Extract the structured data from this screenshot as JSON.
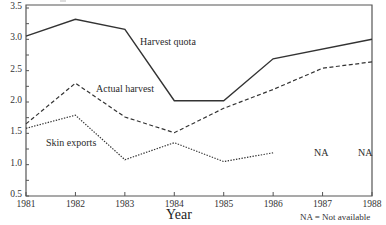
{
  "chart_data": {
    "type": "line",
    "title": "",
    "xlabel": "Year",
    "ylabel": "",
    "x": [
      1981,
      1982,
      1983,
      1984,
      1985,
      1986,
      1987,
      1988
    ],
    "xticks": [
      "1981",
      "1982",
      "1983",
      "1984",
      "1985",
      "1986",
      "1987",
      "1988"
    ],
    "yticks": [
      "0.5",
      "1.0",
      "1.5",
      "2.0",
      "2.5",
      "3.0",
      "3.5"
    ],
    "ylim": [
      0.5,
      3.5
    ],
    "grid": false,
    "legend": "inline labels",
    "series": [
      {
        "name": "Harvest quota",
        "style": "solid",
        "values": [
          3.05,
          3.32,
          3.16,
          2.02,
          2.02,
          2.69,
          null,
          3.0
        ],
        "label_pos": [
          140,
          36
        ]
      },
      {
        "name": "Actual harvest",
        "style": "dashed",
        "values": [
          1.65,
          2.3,
          1.76,
          1.51,
          1.9,
          2.2,
          2.54,
          2.64
        ],
        "label_pos": [
          96,
          83
        ]
      },
      {
        "name": "Skin exports",
        "style": "dotted",
        "values": [
          1.58,
          1.79,
          1.08,
          1.35,
          1.05,
          1.19,
          null,
          null
        ],
        "label_pos": [
          46,
          137
        ]
      }
    ],
    "annotations": [
      {
        "text": "NA",
        "x": 1987,
        "pos": [
          314,
          147
        ]
      },
      {
        "text": "NA",
        "x": 1988,
        "pos": [
          358,
          147
        ]
      }
    ],
    "footnote": "NA = Not available"
  }
}
